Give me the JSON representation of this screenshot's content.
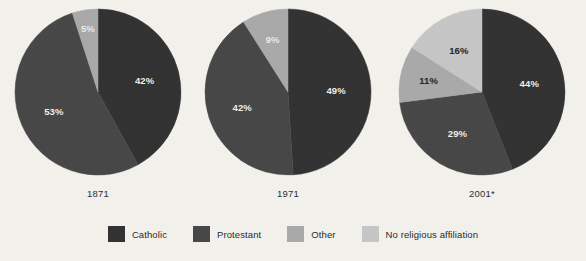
{
  "chart_data": {
    "type": "pie",
    "title": "",
    "legend_position": "bottom",
    "categories": [
      "Catholic",
      "Protestant",
      "Other",
      "No religious affiliation"
    ],
    "colors": [
      "#323232",
      "#474747",
      "#a9a9a9",
      "#c6c6c6"
    ],
    "charts": [
      {
        "label": "1871",
        "slices": [
          {
            "name": "Catholic",
            "value": 42,
            "display": "42%",
            "color": "#323232",
            "label_color": "light"
          },
          {
            "name": "Protestant",
            "value": 53,
            "display": "53%",
            "color": "#474747",
            "label_color": "light"
          },
          {
            "name": "Other",
            "value": 5,
            "display": "5%",
            "color": "#a9a9a9",
            "label_color": "light"
          }
        ]
      },
      {
        "label": "1971",
        "slices": [
          {
            "name": "Catholic",
            "value": 49,
            "display": "49%",
            "color": "#323232",
            "label_color": "light"
          },
          {
            "name": "Protestant",
            "value": 42,
            "display": "42%",
            "color": "#474747",
            "label_color": "light"
          },
          {
            "name": "Other",
            "value": 9,
            "display": "9%",
            "color": "#a9a9a9",
            "label_color": "light"
          }
        ]
      },
      {
        "label": "2001*",
        "slices": [
          {
            "name": "Catholic",
            "value": 44,
            "display": "44%",
            "color": "#323232",
            "label_color": "light"
          },
          {
            "name": "Protestant",
            "value": 29,
            "display": "29%",
            "color": "#474747",
            "label_color": "light"
          },
          {
            "name": "Other",
            "value": 11,
            "display": "11%",
            "color": "#a9a9a9",
            "label_color": "dark"
          },
          {
            "name": "No religious affiliation",
            "value": 16,
            "display": "16%",
            "color": "#c6c6c6",
            "label_color": "dark"
          }
        ]
      }
    ]
  },
  "legend": {
    "items": [
      {
        "label": "Catholic",
        "color": "#323232"
      },
      {
        "label": "Protestant",
        "color": "#474747"
      },
      {
        "label": "Other",
        "color": "#a9a9a9"
      },
      {
        "label": "No religious affiliation",
        "color": "#c6c6c6"
      }
    ]
  },
  "layout": {
    "pie_positions": [
      {
        "left": 14,
        "top": 8,
        "size": 168,
        "label_top": 188
      },
      {
        "left": 204,
        "top": 8,
        "size": 168,
        "label_top": 188
      },
      {
        "left": 398,
        "top": 8,
        "size": 168,
        "label_top": 188
      }
    ]
  }
}
